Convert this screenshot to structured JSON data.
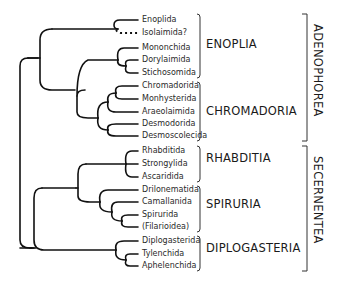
{
  "diagram": {
    "type": "phylogenetic-tree",
    "leaves": [
      {
        "label": "Enoplida",
        "y": 20
      },
      {
        "label": "Isolaimida?",
        "y": 33,
        "dashed": true
      },
      {
        "label": "Mononchida",
        "y": 48
      },
      {
        "label": "Dorylaimida",
        "y": 60
      },
      {
        "label": "Stichosomida",
        "y": 73
      },
      {
        "label": "Chromadorida",
        "y": 86
      },
      {
        "label": "Monhysterida",
        "y": 99
      },
      {
        "label": "Araeolaimida",
        "y": 112
      },
      {
        "label": "Desmodorida",
        "y": 124
      },
      {
        "label": "Desmoscolecida",
        "y": 136
      },
      {
        "label": "Rhabditida",
        "y": 151
      },
      {
        "label": "Strongylida",
        "y": 164
      },
      {
        "label": "Ascaridida",
        "y": 177
      },
      {
        "label": "Drilonematida",
        "y": 190
      },
      {
        "label": "Camallanida",
        "y": 202
      },
      {
        "label": "Spirurida",
        "y": 215
      },
      {
        "label": "(Filarioidea)",
        "y": 227
      },
      {
        "label": "Diplogasterida",
        "y": 241
      },
      {
        "label": "Tylenchida",
        "y": 254
      },
      {
        "label": "Aphelenchida",
        "y": 266
      }
    ],
    "groups": [
      {
        "label": "ENOPLIA",
        "top": 14,
        "bottom": 78,
        "label_y": 44
      },
      {
        "label": "CHROMADORIA",
        "top": 82,
        "bottom": 141,
        "label_y": 111
      },
      {
        "label": "RHABDITIA",
        "top": 146,
        "bottom": 182,
        "label_y": 158
      },
      {
        "label": "SPIRURIA",
        "top": 186,
        "bottom": 232,
        "label_y": 204
      },
      {
        "label": "DIPLOGASTERIA",
        "top": 236,
        "bottom": 271,
        "label_y": 248
      }
    ],
    "classes": [
      {
        "label": "ADENOPHOREA",
        "top": 14,
        "bottom": 141
      },
      {
        "label": "SECERNENTEA",
        "top": 146,
        "bottom": 271
      }
    ]
  }
}
